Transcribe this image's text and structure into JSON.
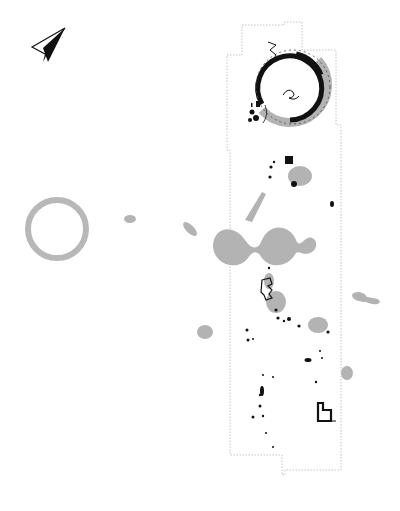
{
  "figure": {
    "type": "archaeological-excavation-plan",
    "caption_visible": false
  },
  "legend_colors": {
    "grey_feature": "#b3b3b3",
    "black_feature": "#111111",
    "trench_edge": "#c8c8c8",
    "background": "#ffffff"
  },
  "north_arrow": {
    "icon": "north-arrow-icon",
    "position": [
      50,
      45
    ]
  },
  "trench": {
    "outline_style": "dotted",
    "points": [
      [
        242,
        25
      ],
      [
        284,
        25
      ],
      [
        284,
        22
      ],
      [
        302,
        22
      ],
      [
        302,
        50
      ],
      [
        336,
        50
      ],
      [
        336,
        125
      ],
      [
        341,
        125
      ],
      [
        341,
        470
      ],
      [
        285,
        470
      ],
      [
        285,
        475
      ],
      [
        282,
        475
      ],
      [
        282,
        455
      ],
      [
        230,
        455
      ],
      [
        230,
        150
      ],
      [
        227,
        150
      ],
      [
        227,
        55
      ],
      [
        242,
        55
      ]
    ]
  },
  "features": {
    "ring_ditch": {
      "cx": 293,
      "cy": 87,
      "r": 33
    },
    "isolated_ring": {
      "cx": 57,
      "cy": 229,
      "r": 29
    },
    "grey_blobs_count": 14,
    "black_features_count": 30
  }
}
